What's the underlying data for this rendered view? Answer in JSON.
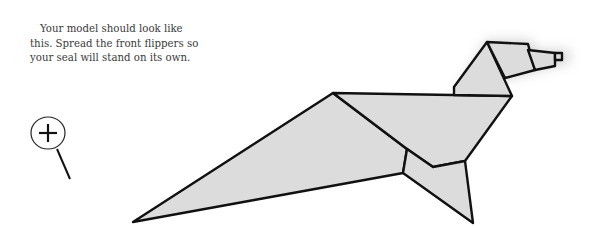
{
  "caption": {
    "lines": [
      "Your model should look like",
      "this. Spread the front flippers so",
      "your seal will stand on its own."
    ]
  },
  "zoom_button": {
    "icon": "magnify-plus-icon",
    "symbol": "+"
  },
  "figure": {
    "fill_color": "#dcdcdc",
    "stroke_color": "#111111",
    "shadow_color": "#bdbdbd"
  }
}
